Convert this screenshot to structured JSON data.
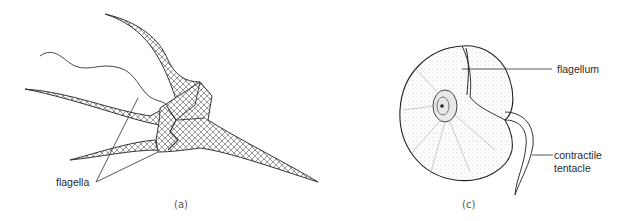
{
  "figure": {
    "panels": [
      {
        "id": "a",
        "caption": "(a)",
        "subject": "dinoflagellate-ceratium",
        "labels": [
          {
            "text": "flagella",
            "pointer_count": 2
          }
        ]
      },
      {
        "id": "c",
        "caption": "(c)",
        "subject": "dinoflagellate-noctiluca",
        "labels": [
          {
            "text": "flagellum"
          },
          {
            "text": "contractile",
            "line2": "tentacle"
          }
        ]
      }
    ],
    "colors": {
      "ink": "#2a2a2a",
      "background": "#ffffff"
    }
  }
}
